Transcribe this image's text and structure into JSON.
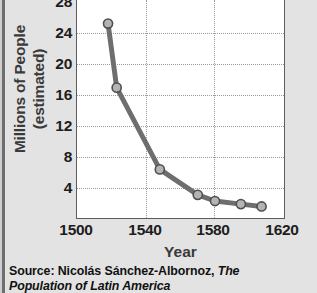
{
  "chart_data": {
    "type": "line",
    "title": "",
    "subtitle": "",
    "xlabel": "Year",
    "ylabel": "Millions of People (estimated)",
    "ylabel_line1": "Millions of People",
    "ylabel_line2": "(estimated)",
    "xlim": [
      1500,
      1620
    ],
    "ylim": [
      0,
      28
    ],
    "xticks": [
      1500,
      1540,
      1580,
      1620
    ],
    "xtick_labels": [
      "1500",
      "1540",
      "1580",
      "1620"
    ],
    "yticks": [
      4,
      8,
      12,
      16,
      20,
      24,
      28
    ],
    "ytick_labels": [
      "4",
      "8",
      "12",
      "16",
      "20",
      "24",
      "28"
    ],
    "grid": true,
    "grid_style": "dotted",
    "legend": false,
    "legend_position": "none",
    "series": [
      {
        "name": "Population of Latin America",
        "color": "#6e6e6e",
        "marker": "circle",
        "x": [
          1518,
          1523,
          1548,
          1570,
          1580,
          1595,
          1607
        ],
        "y": [
          25.2,
          16.9,
          6.3,
          3.0,
          2.2,
          1.8,
          1.5
        ],
        "points": [
          {
            "x": 1518,
            "y": 25.2
          },
          {
            "x": 1523,
            "y": 16.9
          },
          {
            "x": 1548,
            "y": 6.3
          },
          {
            "x": 1570,
            "y": 3.0
          },
          {
            "x": 1580,
            "y": 2.2
          },
          {
            "x": 1595,
            "y": 1.8
          },
          {
            "x": 1607,
            "y": 1.5
          }
        ]
      }
    ]
  },
  "source": {
    "prefix": "Source: Nicolás Sánchez-Albornoz, ",
    "title_line1": "The",
    "title_line2": "Population of Latin America",
    "full": "Source: Nicolás Sánchez-Albornoz, The Population of Latin America"
  },
  "colors": {
    "background": "#e3e3e3",
    "plot_background": "#ffffff",
    "axis": "#5d5d5d",
    "grid": "#9a9a9a",
    "line": "#6e6e6e",
    "marker_fill": "#b4b4b4",
    "text": "#1d1d1d"
  }
}
